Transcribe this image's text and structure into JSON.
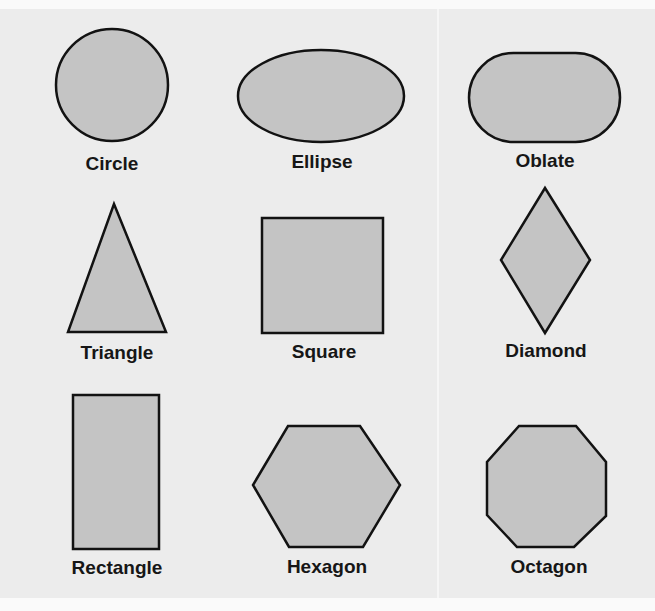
{
  "style": {
    "background": "#ececec",
    "fill": "#c4c4c4",
    "stroke": "#121212",
    "label_color": "#161616"
  },
  "shapes": [
    {
      "name": "circle",
      "label": "Circle"
    },
    {
      "name": "ellipse",
      "label": "Ellipse"
    },
    {
      "name": "oblate",
      "label": "Oblate"
    },
    {
      "name": "triangle",
      "label": "Triangle"
    },
    {
      "name": "square",
      "label": "Square"
    },
    {
      "name": "diamond",
      "label": "Diamond"
    },
    {
      "name": "rectangle",
      "label": "Rectangle"
    },
    {
      "name": "hexagon",
      "label": "Hexagon"
    },
    {
      "name": "octagon",
      "label": "Octagon"
    }
  ]
}
